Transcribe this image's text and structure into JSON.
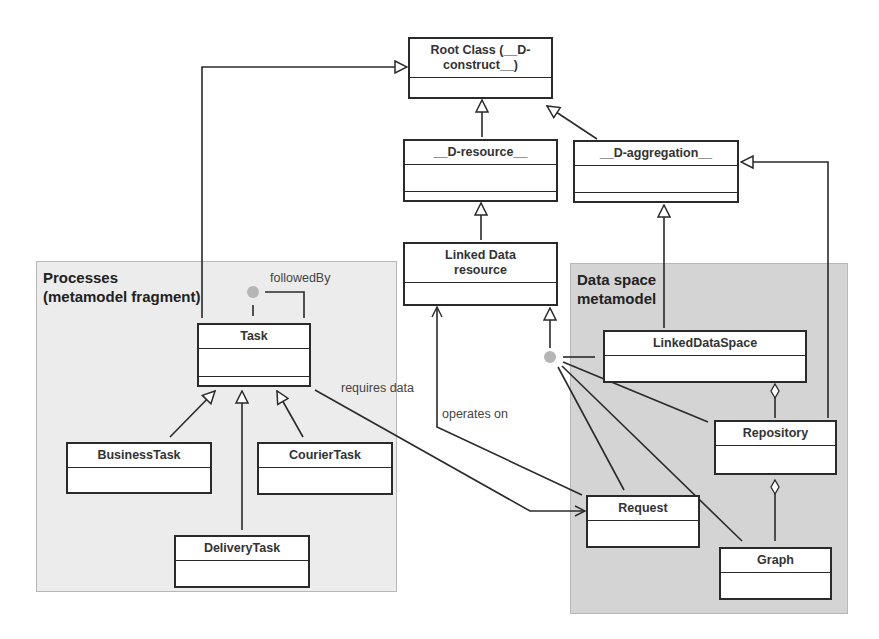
{
  "diagram": {
    "type": "UML class diagram",
    "regions": [
      {
        "id": "processes",
        "title": "Processes\n(metamodel fragment)"
      },
      {
        "id": "dataspace",
        "title": "Data space\nmetamodel"
      }
    ],
    "classes": {
      "root": {
        "name": "Root Class (__D-\nconstruct__)"
      },
      "d_resource": {
        "name": "__D-resource__"
      },
      "d_aggregation": {
        "name": "__D-aggregation__"
      },
      "linked_data_resource": {
        "name": "Linked Data\nresource"
      },
      "task": {
        "name": "Task"
      },
      "business_task": {
        "name": "BusinessTask"
      },
      "courier_task": {
        "name": "CourierTask"
      },
      "delivery_task": {
        "name": "DeliveryTask"
      },
      "linked_data_space": {
        "name": "LinkedDataSpace"
      },
      "repository": {
        "name": "Repository"
      },
      "request": {
        "name": "Request"
      },
      "graph": {
        "name": "Graph"
      }
    },
    "labels": {
      "followed_by": "followedBy",
      "requires_data": "requires data",
      "operates_on": "operates on"
    },
    "relationships": [
      {
        "type": "generalization",
        "from": "Task",
        "to": "Root Class (__D-construct__)"
      },
      {
        "type": "generalization",
        "from": "__D-resource__",
        "to": "Root Class (__D-construct__)"
      },
      {
        "type": "generalization",
        "from": "__D-aggregation__",
        "to": "Root Class (__D-construct__)"
      },
      {
        "type": "generalization",
        "from": "Linked Data resource",
        "to": "__D-resource__"
      },
      {
        "type": "generalization",
        "from": "LinkedDataSpace",
        "to": "__D-aggregation__"
      },
      {
        "type": "generalization",
        "from": "Repository",
        "to": "__D-aggregation__"
      },
      {
        "type": "generalization",
        "from": "BusinessTask",
        "to": "Task"
      },
      {
        "type": "generalization",
        "from": "CourierTask",
        "to": "Task"
      },
      {
        "type": "generalization",
        "from": "DeliveryTask",
        "to": "Task"
      },
      {
        "type": "generalization",
        "from": "{LinkedDataSpace, Repository, Request, Graph}",
        "to": "Linked Data resource"
      },
      {
        "type": "association",
        "from": "Task",
        "to": "Task",
        "label": "followedBy"
      },
      {
        "type": "association",
        "from": "Task",
        "to": "Request",
        "label": "requires data"
      },
      {
        "type": "association",
        "from": "Request",
        "to": "Linked Data resource",
        "label": "operates on"
      },
      {
        "type": "aggregation",
        "from": "Repository",
        "to": "LinkedDataSpace"
      },
      {
        "type": "aggregation",
        "from": "Graph",
        "to": "Repository"
      }
    ],
    "colors": {
      "processes_bg": "#ececec",
      "dataspace_bg": "#d4d4d4",
      "line": "#2a2a2a",
      "junction_dot": "#b5b5b5"
    }
  }
}
